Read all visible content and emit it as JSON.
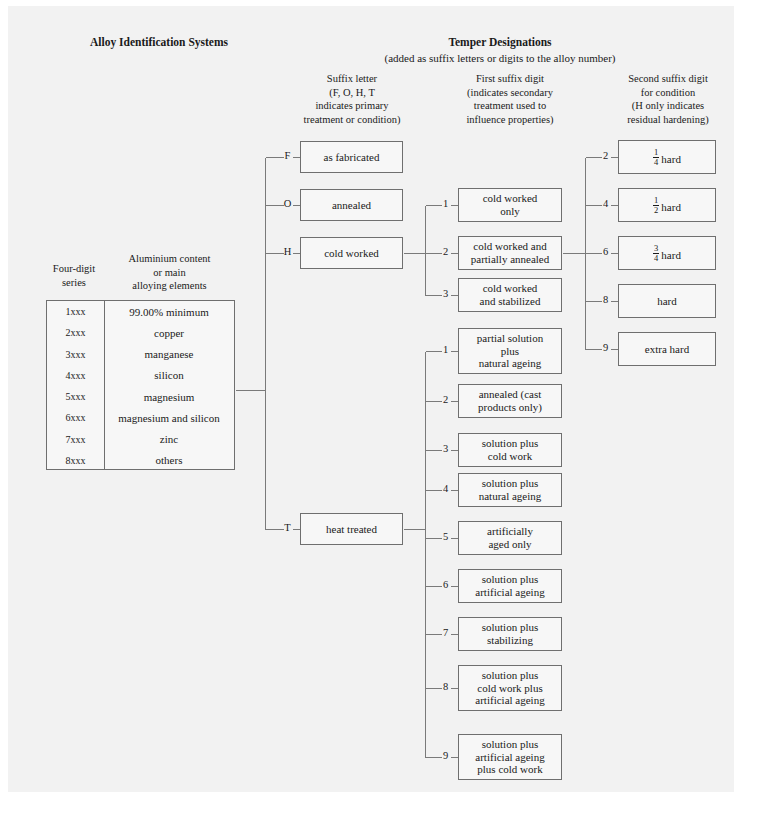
{
  "headers": {
    "left_title": "Alloy Identification Systems",
    "right_title": "Temper Designations",
    "right_subtitle": "(added as suffix letters or digits to the alloy number)",
    "col1": "Suffix letter\n(F, O, H, T\nindicates primary\ntreatment or condition)",
    "col2": "First suffix digit\n(indicates secondary\ntreatment used to\ninfluence properties)",
    "col3": "Second suffix digit\nfor condition\n(H only indicates\nresidual hardening)"
  },
  "alloy_table": {
    "header_series": "Four-digit\nseries",
    "header_content": "Aluminium content\nor main\nalloying elements",
    "rows": [
      {
        "series": "1xxx",
        "description": "99.00% minimum"
      },
      {
        "series": "2xxx",
        "description": "copper"
      },
      {
        "series": "3xxx",
        "description": "manganese"
      },
      {
        "series": "4xxx",
        "description": "silicon"
      },
      {
        "series": "5xxx",
        "description": "magnesium"
      },
      {
        "series": "6xxx",
        "description": "magnesium and silicon"
      },
      {
        "series": "7xxx",
        "description": "zinc"
      },
      {
        "series": "8xxx",
        "description": "others"
      }
    ]
  },
  "suffix_letters": [
    {
      "letter": "F",
      "label": "as fabricated"
    },
    {
      "letter": "O",
      "label": "annealed"
    },
    {
      "letter": "H",
      "label": "cold worked"
    },
    {
      "letter": "T",
      "label": "heat treated"
    }
  ],
  "h_digits": [
    {
      "digit": "1",
      "label": "cold worked\nonly"
    },
    {
      "digit": "2",
      "label": "cold worked and\npartially annealed"
    },
    {
      "digit": "3",
      "label": "cold worked\nand stabilized"
    }
  ],
  "t_digits": [
    {
      "digit": "1",
      "label": "partial solution\nplus\nnatural ageing"
    },
    {
      "digit": "2",
      "label": "annealed (cast\nproducts only)"
    },
    {
      "digit": "3",
      "label": "solution plus\ncold work"
    },
    {
      "digit": "4",
      "label": "solution plus\nnatural ageing"
    },
    {
      "digit": "5",
      "label": "artificially\naged only"
    },
    {
      "digit": "6",
      "label": "solution plus\nartificial ageing"
    },
    {
      "digit": "7",
      "label": "solution plus\nstabilizing"
    },
    {
      "digit": "8",
      "label": "solution plus\ncold work plus\nartificial ageing"
    },
    {
      "digit": "9",
      "label": "solution plus\nartificial ageing\nplus cold work"
    }
  ],
  "hardness": [
    {
      "digit": "2",
      "label": "¼ hard",
      "num": "1",
      "den": "4",
      "word": "hard"
    },
    {
      "digit": "4",
      "label": "½ hard",
      "num": "1",
      "den": "2",
      "word": "hard"
    },
    {
      "digit": "6",
      "label": "¾ hard",
      "num": "3",
      "den": "4",
      "word": "hard"
    },
    {
      "digit": "8",
      "label": "hard",
      "num": "",
      "den": "",
      "word": "hard"
    },
    {
      "digit": "9",
      "label": "extra hard",
      "num": "",
      "den": "",
      "word": "extra hard"
    }
  ],
  "colors": {
    "page_bg": "#f2f2f2",
    "box_border": "#6f6f6f",
    "line": "#7a7a7a",
    "text": "#1a1a1a"
  }
}
